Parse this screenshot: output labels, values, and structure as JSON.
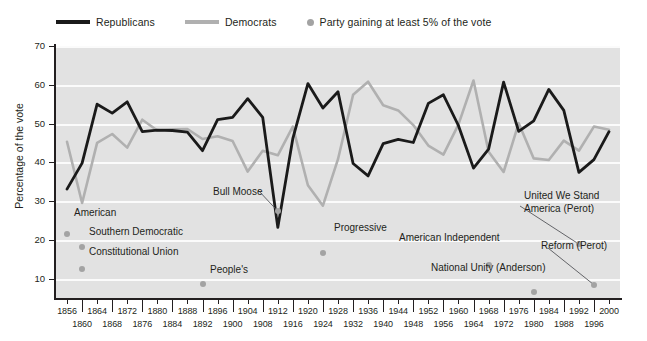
{
  "legend": {
    "items": [
      {
        "label": "Republicans",
        "type": "line",
        "color": "#1a1a1a"
      },
      {
        "label": "Democrats",
        "type": "line",
        "color": "#b0b0b0"
      },
      {
        "label": "Party gaining at least 5% of the vote",
        "type": "dot",
        "color": "#a3a3a3"
      }
    ]
  },
  "chart_data": {
    "type": "line",
    "title": "",
    "xlabel": "",
    "ylabel": "Percentage of the vote",
    "ylim": [
      5,
      70
    ],
    "yticks": [
      10,
      20,
      30,
      40,
      50,
      60,
      70
    ],
    "grid": true,
    "legend_position": "top-left",
    "x": [
      1856,
      1860,
      1864,
      1868,
      1872,
      1876,
      1880,
      1884,
      1888,
      1892,
      1896,
      1900,
      1904,
      1908,
      1912,
      1916,
      1920,
      1924,
      1928,
      1932,
      1936,
      1940,
      1944,
      1948,
      1952,
      1956,
      1960,
      1964,
      1968,
      1972,
      1976,
      1980,
      1984,
      1988,
      1992,
      1996,
      2000
    ],
    "series": [
      {
        "name": "Republicans",
        "color": "#1a1a1a",
        "values": [
          33.1,
          39.8,
          55.0,
          52.7,
          55.6,
          47.9,
          48.3,
          48.2,
          47.8,
          43.0,
          51.0,
          51.6,
          56.4,
          51.6,
          23.2,
          46.1,
          60.3,
          54.0,
          58.2,
          39.7,
          36.5,
          44.8,
          45.9,
          45.1,
          55.2,
          57.4,
          49.5,
          38.5,
          43.4,
          60.7,
          48.0,
          50.7,
          58.8,
          53.4,
          37.4,
          40.7,
          47.9
        ]
      },
      {
        "name": "Democrats",
        "color": "#b0b0b0",
        "values": [
          45.3,
          29.5,
          45.0,
          47.3,
          43.8,
          51.0,
          48.2,
          48.5,
          48.6,
          46.0,
          46.7,
          45.5,
          37.6,
          43.0,
          41.8,
          49.2,
          34.1,
          28.8,
          40.8,
          57.4,
          60.8,
          54.7,
          53.4,
          49.6,
          44.3,
          42.0,
          49.7,
          61.1,
          42.7,
          37.5,
          50.1,
          41.0,
          40.6,
          45.6,
          43.0,
          49.2,
          48.4
        ]
      }
    ],
    "third_party_points": [
      {
        "label": "American",
        "year": 1856,
        "value": 21.6,
        "leader": false
      },
      {
        "label": "Southern Democratic",
        "year": 1860,
        "value": 18.1,
        "leader": false
      },
      {
        "label": "Constitutional Union",
        "year": 1860,
        "value": 12.6,
        "leader": false
      },
      {
        "label": "People's",
        "year": 1892,
        "value": 8.5,
        "leader": false
      },
      {
        "label": "Bull Moose",
        "year": 1912,
        "value": 27.4,
        "leader": true
      },
      {
        "label": "Progressive",
        "year": 1924,
        "value": 16.6,
        "leader": false
      },
      {
        "label": "American Independent",
        "year": 1968,
        "value": 13.5,
        "leader": false
      },
      {
        "label": "National Unity (Anderson)",
        "year": 1980,
        "value": 6.6,
        "leader": false
      },
      {
        "label": "United We Stand America (Perot)",
        "year": 1992,
        "value": 18.9,
        "leader": true
      },
      {
        "label": "Reform (Perot)",
        "year": 1996,
        "value": 8.4,
        "leader": true
      }
    ]
  },
  "xaxis": {
    "labels_top": [
      "1856",
      "1864",
      "1872",
      "1880",
      "1888",
      "1896",
      "1904",
      "1912",
      "1920",
      "1928",
      "1936",
      "1944",
      "1952",
      "1960",
      "1968",
      "1976",
      "1984",
      "1992",
      "2000"
    ],
    "labels_bottom": [
      "1860",
      "1868",
      "1876",
      "1884",
      "1892",
      "1900",
      "1908",
      "1916",
      "1924",
      "1932",
      "1940",
      "1948",
      "1956",
      "1964",
      "1972",
      "1980",
      "1988",
      "1996"
    ]
  },
  "annotations": {
    "bull_moose": "Bull Moose",
    "progressive": "Progressive",
    "american": "American",
    "southern_democratic": "Southern Democratic",
    "constitutional_union": "Constitutional Union",
    "peoples": "People's",
    "american_independent": "American Independent",
    "national_unity": "National Unity (Anderson)",
    "uwsa_line1": "United We Stand",
    "uwsa_line2": "America (Perot)",
    "reform": "Reform (Perot)"
  }
}
